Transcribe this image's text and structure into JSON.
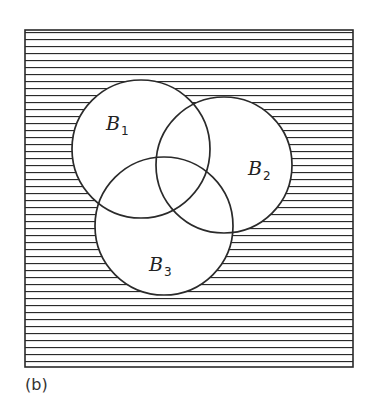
{
  "diagram": {
    "type": "venn",
    "universe": {
      "x": 25,
      "y": 30,
      "width": 328,
      "height": 337,
      "hatch": "horizontal",
      "hatch_spacing": 7
    },
    "sets": [
      {
        "name": "B",
        "subscript": "1",
        "cx": 141,
        "cy": 149,
        "r": 69,
        "label_x": 106,
        "label_y": 130
      },
      {
        "name": "B",
        "subscript": "2",
        "cx": 224,
        "cy": 165,
        "r": 68,
        "label_x": 248,
        "label_y": 175
      },
      {
        "name": "B",
        "subscript": "3",
        "cx": 164,
        "cy": 226,
        "r": 69,
        "label_x": 149,
        "label_y": 271
      }
    ],
    "shaded_region": "complement of B1 ∪ B2 ∪ B3",
    "colors": {
      "line": "#2a2a2a",
      "background": "#ffffff"
    }
  },
  "caption": "(b)"
}
